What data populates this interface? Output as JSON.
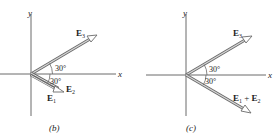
{
  "panels": [
    {
      "id": "b",
      "caption": "(b)",
      "axes": {
        "x_label": "x",
        "y_label": "y"
      },
      "vectors": [
        {
          "name": "E3",
          "label_main": "E",
          "label_sub": "3",
          "angle_deg": 30,
          "direction": "above x-axis"
        },
        {
          "name": "E2",
          "label_main": "E",
          "label_sub": "2",
          "angle_deg": -30,
          "direction": "below x-axis"
        },
        {
          "name": "E1",
          "label_main": "E",
          "label_sub": "1",
          "angle_deg": -30,
          "direction": "below x-axis"
        }
      ],
      "angle_labels": [
        "30°",
        "30°"
      ]
    },
    {
      "id": "c",
      "caption": "(c)",
      "axes": {
        "x_label": "x",
        "y_label": "y"
      },
      "vectors": [
        {
          "name": "E3",
          "label_main": "E",
          "label_sub": "3",
          "angle_deg": 30,
          "direction": "above x-axis"
        },
        {
          "name": "E1+E2",
          "label_main1": "E",
          "label_sub1": "1",
          "plus": " + ",
          "label_main2": "E",
          "label_sub2": "2",
          "angle_deg": -30,
          "direction": "below x-axis"
        }
      ],
      "angle_labels": [
        "30°",
        "30°"
      ]
    }
  ],
  "colors": {
    "axis": "#6a6a6a",
    "vector_fill": "#c9c9c9",
    "vector_stroke": "#6a6a6a",
    "text": "#222222"
  }
}
